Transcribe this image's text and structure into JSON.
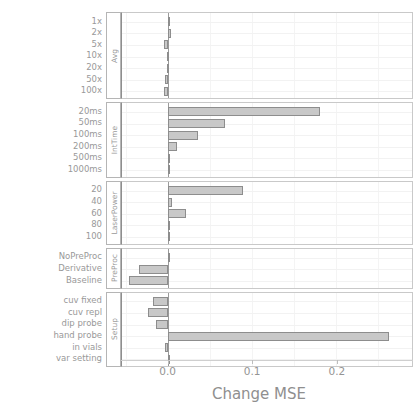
{
  "chart_data": {
    "type": "bar",
    "orientation": "horizontal",
    "title": "",
    "xlabel": "Change MSE",
    "ylabel": "Setting",
    "xlim": [
      -0.055,
      0.29
    ],
    "xticks": [
      0.0,
      0.1,
      0.2
    ],
    "xticklabels": [
      "0.0",
      "0.1",
      "0.2"
    ],
    "grid": true,
    "legend": "none",
    "panels": [
      {
        "group": "Avg",
        "categories": [
          "1x",
          "2x",
          "5x",
          "10x",
          "20x",
          "50x",
          "100x"
        ],
        "values": [
          0.0,
          0.003,
          -0.005,
          -0.002,
          -0.0012,
          -0.004,
          -0.005
        ]
      },
      {
        "group": "IntTime",
        "categories": [
          "20ms",
          "50ms",
          "100ms",
          "200ms",
          "500ms",
          "1000ms"
        ],
        "values": [
          0.18,
          0.067,
          0.036,
          0.01,
          0.0,
          -0.0008
        ]
      },
      {
        "group": "LaserPower",
        "categories": [
          "20",
          "40",
          "60",
          "80",
          "100"
        ],
        "values": [
          0.089,
          0.004,
          0.021,
          0.0,
          -0.0006
        ]
      },
      {
        "group": "PreProc",
        "categories": [
          "NoPreProc",
          "Derivative",
          "Baseline"
        ],
        "values": [
          0.0,
          -0.035,
          -0.047
        ]
      },
      {
        "group": "Setup",
        "categories": [
          "cuv fixed",
          "cuv repl",
          "dip probe",
          "hand probe",
          "in vials",
          "var setting"
        ],
        "values": [
          -0.018,
          -0.024,
          -0.015,
          0.263,
          -0.004,
          0.0
        ]
      }
    ]
  },
  "colors": {
    "bar_fill": "#c8c8c8",
    "bar_edge": "#8d8d8d",
    "grid": "#ececec",
    "text": "#949494",
    "axis": "#8e8e8e",
    "background": "#ffffff"
  }
}
